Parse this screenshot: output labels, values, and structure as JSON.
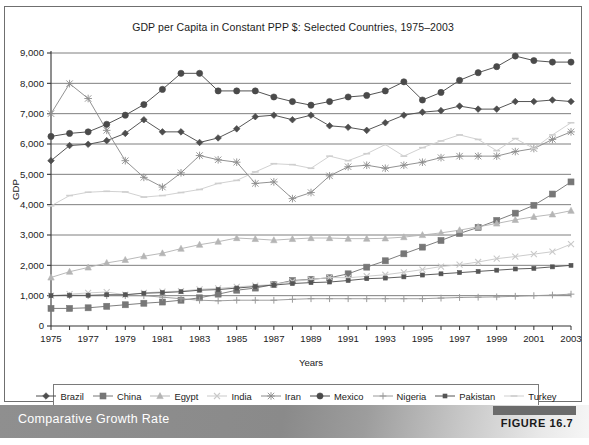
{
  "figure": {
    "caption": "Comparative Growth Rate",
    "label": "FIGURE 16.7"
  },
  "chart_data": {
    "type": "line",
    "title": "GDP per Capita in Constant PPP $: Selected Countries, 1975–2003",
    "xlabel": "Years",
    "ylabel": "GDP",
    "grid": true,
    "legend_position": "bottom",
    "xlim": [
      1975,
      2003
    ],
    "ylim": [
      0,
      9000
    ],
    "ytick_labels": [
      "0",
      "1,000",
      "2,000",
      "3,000",
      "4,000",
      "5,000",
      "6,000",
      "7,000",
      "8,000",
      "9,000"
    ],
    "yticks": [
      0,
      1000,
      2000,
      3000,
      4000,
      5000,
      6000,
      7000,
      8000,
      9000
    ],
    "xtick_labels": [
      "1975",
      "1977",
      "1979",
      "1981",
      "1983",
      "1985",
      "1987",
      "1989",
      "1991",
      "1993",
      "1995",
      "1997",
      "1999",
      "2001",
      "2003"
    ],
    "x": [
      1975,
      1976,
      1977,
      1978,
      1979,
      1980,
      1981,
      1982,
      1983,
      1984,
      1985,
      1986,
      1987,
      1988,
      1989,
      1990,
      1991,
      1992,
      1993,
      1994,
      1995,
      1996,
      1997,
      1998,
      1999,
      2000,
      2001,
      2002,
      2003
    ],
    "series": [
      {
        "name": "Brazil",
        "marker": "diamond",
        "color": "#4d4d4d",
        "values": [
          5450,
          5950,
          5990,
          6110,
          6350,
          6800,
          6400,
          6400,
          6050,
          6200,
          6500,
          6900,
          6950,
          6800,
          6950,
          6600,
          6550,
          6450,
          6700,
          6950,
          7050,
          7100,
          7250,
          7150,
          7150,
          7400,
          7400,
          7450,
          7400
        ]
      },
      {
        "name": "China",
        "marker": "square",
        "color": "#777777",
        "values": [
          580,
          580,
          600,
          650,
          700,
          750,
          790,
          850,
          930,
          1050,
          1180,
          1250,
          1370,
          1500,
          1540,
          1590,
          1720,
          1940,
          2150,
          2380,
          2600,
          2820,
          3050,
          3250,
          3480,
          3720,
          3980,
          4350,
          4750
        ]
      },
      {
        "name": "Egypt",
        "marker": "triangle",
        "color": "#b5b5b5",
        "values": [
          1600,
          1790,
          1930,
          2080,
          2180,
          2300,
          2400,
          2550,
          2680,
          2780,
          2900,
          2870,
          2830,
          2870,
          2900,
          2900,
          2880,
          2880,
          2890,
          2930,
          3000,
          3070,
          3160,
          3270,
          3380,
          3500,
          3600,
          3680,
          3800
        ]
      },
      {
        "name": "India",
        "marker": "x",
        "color": "#c9c9c9",
        "values": [
          1000,
          1050,
          1090,
          1120,
          1030,
          1090,
          1130,
          1150,
          1210,
          1240,
          1290,
          1330,
          1370,
          1470,
          1530,
          1600,
          1590,
          1640,
          1690,
          1770,
          1860,
          1960,
          2020,
          2110,
          2220,
          2290,
          2370,
          2450,
          2700
        ]
      },
      {
        "name": "Iran",
        "marker": "asterisk",
        "color": "#8c8c8c",
        "values": [
          7000,
          7990,
          7500,
          6450,
          5450,
          4900,
          4580,
          5050,
          5620,
          5480,
          5400,
          4700,
          4750,
          4200,
          4400,
          4950,
          5250,
          5300,
          5200,
          5300,
          5400,
          5550,
          5600,
          5600,
          5600,
          5750,
          5850,
          6150,
          6400
        ]
      },
      {
        "name": "Mexico",
        "marker": "circle",
        "color": "#4a4a4a",
        "values": [
          6250,
          6350,
          6400,
          6650,
          6950,
          7300,
          7800,
          8330,
          8330,
          7750,
          7750,
          7750,
          7550,
          7400,
          7280,
          7400,
          7550,
          7600,
          7750,
          8050,
          7450,
          7700,
          8100,
          8350,
          8550,
          8900,
          8750,
          8700,
          8700
        ]
      },
      {
        "name": "Nigeria",
        "marker": "plus",
        "color": "#9a9a9a",
        "values": [
          1000,
          1000,
          1000,
          1000,
          1000,
          1000,
          950,
          900,
          850,
          830,
          850,
          850,
          850,
          880,
          900,
          900,
          900,
          900,
          900,
          900,
          900,
          920,
          940,
          950,
          960,
          980,
          1000,
          1020,
          1050
        ]
      },
      {
        "name": "Pakistan",
        "marker": "smallsquare",
        "color": "#555555",
        "values": [
          1000,
          1010,
          1010,
          1030,
          1030,
          1080,
          1100,
          1130,
          1180,
          1200,
          1250,
          1300,
          1350,
          1400,
          1430,
          1450,
          1500,
          1560,
          1580,
          1620,
          1680,
          1720,
          1760,
          1800,
          1840,
          1880,
          1900,
          1950,
          2000
        ]
      },
      {
        "name": "Turkey",
        "marker": "dash",
        "color": "#cfcfcf",
        "values": [
          3960,
          4300,
          4410,
          4440,
          4420,
          4250,
          4300,
          4400,
          4500,
          4700,
          4800,
          5080,
          5350,
          5320,
          5200,
          5600,
          5450,
          5680,
          5980,
          5600,
          5880,
          6100,
          6300,
          6150,
          5780,
          6180,
          5850,
          6300,
          6700
        ]
      }
    ]
  }
}
